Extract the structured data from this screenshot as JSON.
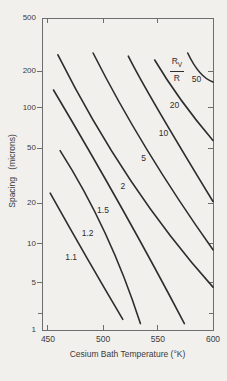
{
  "figure": {
    "background_color": "#f1f0ed",
    "axis_color": "#6e6e6e",
    "curve_color": "#2d2d2d",
    "text_color": "#3b3b3b"
  },
  "chart_data": {
    "type": "line",
    "title": "",
    "xlabel": "Cesium Bath Temperature (°K)",
    "ylabel": "Spacing (microns)",
    "grid": false,
    "legend_quantity": {
      "numerator": "R",
      "numerator_sub": "V",
      "denominator": "R",
      "fx": 0.789,
      "fy": 0.171
    },
    "x_axis": {
      "scale": "linear",
      "range": [
        444,
        601
      ],
      "ticks": [
        {
          "value": 450,
          "label": "450",
          "frac": 0.035
        },
        {
          "value": 500,
          "label": "500",
          "frac": 0.357
        },
        {
          "value": 550,
          "label": "550",
          "frac": 0.678
        },
        {
          "value": 600,
          "label": "600",
          "frac": 1.0
        }
      ]
    },
    "y_axis": {
      "scale": "log",
      "range": [
        1,
        500
      ],
      "ticks": [
        {
          "value": 500,
          "label": "500",
          "frac": 0.0
        },
        {
          "value": 200,
          "label": "200",
          "frac": 0.17
        },
        {
          "value": 100,
          "label": "100",
          "frac": 0.288
        },
        {
          "value": 50,
          "label": "50",
          "frac": 0.417
        },
        {
          "value": 20,
          "label": "20",
          "frac": 0.593
        },
        {
          "value": 10,
          "label": "10",
          "frac": 0.724
        },
        {
          "value": 5,
          "label": "5",
          "frac": 0.849
        },
        {
          "value": 2,
          "label": "",
          "frac": 0.946
        },
        {
          "value": 1,
          "label": "1",
          "frac": 1.0
        }
      ]
    },
    "series": [
      {
        "label": "1.1",
        "points": [
          [
            452,
            23.6
          ],
          [
            485,
            7.9
          ],
          [
            518,
            1.55
          ]
        ],
        "label_at": [
          471,
          7.8
        ]
      },
      {
        "label": "1.2",
        "points": [
          [
            461,
            48
          ],
          [
            502,
            12.0
          ],
          [
            534,
            1.3
          ]
        ],
        "label_at": [
          486,
          12.0
        ]
      },
      {
        "label": "1.5",
        "points": [
          [
            455,
            140
          ],
          [
            518,
            17.8
          ],
          [
            574,
            1.3
          ]
        ],
        "label_at": [
          500,
          17.5
        ]
      },
      {
        "label": "2",
        "points": [
          [
            459,
            265
          ],
          [
            525,
            29.3
          ],
          [
            600,
            4.4
          ]
        ],
        "label_at": [
          518,
          26.5
        ]
      },
      {
        "label": "5",
        "points": [
          [
            491,
            273
          ],
          [
            540,
            48.7
          ],
          [
            600,
            9.0
          ]
        ],
        "label_at": [
          537,
          42
        ]
      },
      {
        "label": "10",
        "points": [
          [
            523,
            259
          ],
          [
            550,
            97
          ],
          [
            600,
            20.5
          ]
        ],
        "label_at": [
          555,
          64
        ]
      },
      {
        "label": "20",
        "points": [
          [
            547,
            242
          ],
          [
            571,
            116
          ],
          [
            600,
            57
          ]
        ],
        "label_at": [
          565,
          104
        ]
      },
      {
        "label": "50",
        "points": [
          [
            577,
            273
          ],
          [
            588,
            195
          ],
          [
            600,
            163
          ]
        ],
        "label_at": [
          585,
          172
        ]
      }
    ]
  }
}
